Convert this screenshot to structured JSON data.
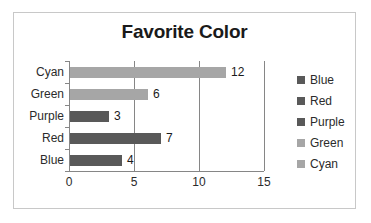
{
  "chart_data": {
    "type": "bar",
    "orientation": "horizontal",
    "title": "Favorite Color",
    "xlabel": "",
    "ylabel": "",
    "categories": [
      "Cyan",
      "Green",
      "Purple",
      "Red",
      "Blue"
    ],
    "values": [
      12,
      6,
      3,
      7,
      4
    ],
    "data_labels": [
      "12",
      "6",
      "3",
      "7",
      "4"
    ],
    "bar_colors": [
      "#a6a6a6",
      "#a6a6a6",
      "#595959",
      "#595959",
      "#595959"
    ],
    "xlim": [
      0,
      15
    ],
    "xticks": [
      0,
      5,
      10,
      15
    ],
    "xtick_labels": [
      "0",
      "5",
      "10",
      "15"
    ],
    "grid": true,
    "gridlines_at": [
      5,
      10,
      15
    ],
    "legend_position": "right",
    "legend": [
      {
        "label": "Blue",
        "color": "#595959"
      },
      {
        "label": "Red",
        "color": "#595959"
      },
      {
        "label": "Purple",
        "color": "#595959"
      },
      {
        "label": "Green",
        "color": "#a6a6a6"
      },
      {
        "label": "Cyan",
        "color": "#a6a6a6"
      }
    ]
  },
  "frame": {
    "border_color": "#c8c8c8",
    "background": "#ffffff",
    "axis_color": "#868686",
    "title_color": "#1a1a1a",
    "text_color": "#2b2b2b"
  }
}
